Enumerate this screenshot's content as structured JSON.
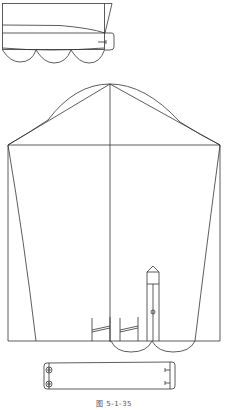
{
  "figure": {
    "caption": "图 5-1-35",
    "line_color": "#333333",
    "background": "#ffffff"
  },
  "parts": {
    "top_piece": {
      "label": "cuff-folded-piece"
    },
    "sleeve": {
      "label": "sleeve-pattern"
    },
    "placket": {
      "label": "sleeve-placket"
    },
    "cuff": {
      "label": "cuff-pattern"
    }
  }
}
